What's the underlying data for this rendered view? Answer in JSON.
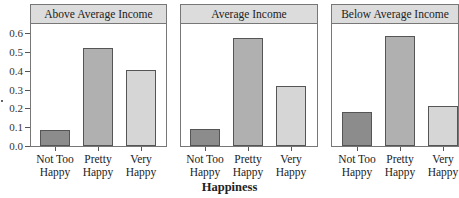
{
  "chart_data": {
    "type": "bar",
    "title": "",
    "xlabel": "Happiness",
    "ylabel": "",
    "ylim": [
      0,
      0.65
    ],
    "yticks": [
      "0.0",
      "0.1",
      "0.2",
      "0.3",
      "0.4",
      "0.5",
      "0.6"
    ],
    "categories": [
      "Not Too Happy",
      "Pretty Happy",
      "Very Happy"
    ],
    "category_lines": [
      [
        "Not Too",
        "Happy"
      ],
      [
        "Pretty",
        "Happy"
      ],
      [
        "Very",
        "Happy"
      ]
    ],
    "bar_colors": [
      "#8c8c8c",
      "#b0b0b0",
      "#d6d6d6"
    ],
    "grid": false,
    "legend": null,
    "panels": [
      {
        "name": "Above Average Income",
        "values": [
          0.085,
          0.52,
          0.4
        ]
      },
      {
        "name": "Average Income",
        "values": [
          0.09,
          0.57,
          0.32
        ]
      },
      {
        "name": "Below Average Income",
        "values": [
          0.18,
          0.58,
          0.21
        ]
      }
    ]
  },
  "colors": {
    "header_fill": "#dcdcdc",
    "border": "#777777"
  }
}
